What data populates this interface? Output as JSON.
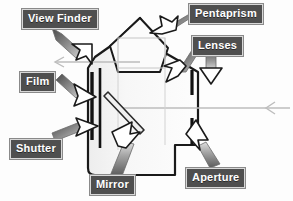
{
  "diagram": {
    "background_color": "#fdfdfd",
    "label_background_color": "#4f4f4f",
    "label_text_color": "#ffffff",
    "outline_color": "#1a1a1a",
    "ray_color": "#b9b9b9",
    "labels": [
      {
        "id": "view-finder",
        "text": "View Finder",
        "x": 22,
        "y": 9
      },
      {
        "id": "pentaprism",
        "text": "Pentaprism",
        "x": 189,
        "y": 4
      },
      {
        "id": "lenses",
        "text": "Lenses",
        "x": 192,
        "y": 36
      },
      {
        "id": "film",
        "text": "Film",
        "x": 20,
        "y": 72
      },
      {
        "id": "shutter",
        "text": "Shutter",
        "x": 10,
        "y": 139
      },
      {
        "id": "mirror",
        "text": "Mirror",
        "x": 90,
        "y": 175
      },
      {
        "id": "aperture",
        "text": "Aperture",
        "x": 186,
        "y": 168
      }
    ],
    "parts": [
      {
        "id": "view-finder",
        "name": "View Finder"
      },
      {
        "id": "pentaprism",
        "name": "Pentaprism"
      },
      {
        "id": "lenses",
        "name": "Lenses"
      },
      {
        "id": "film",
        "name": "Film"
      },
      {
        "id": "shutter",
        "name": "Shutter"
      },
      {
        "id": "mirror",
        "name": "Mirror"
      },
      {
        "id": "aperture",
        "name": "Aperture"
      }
    ]
  }
}
